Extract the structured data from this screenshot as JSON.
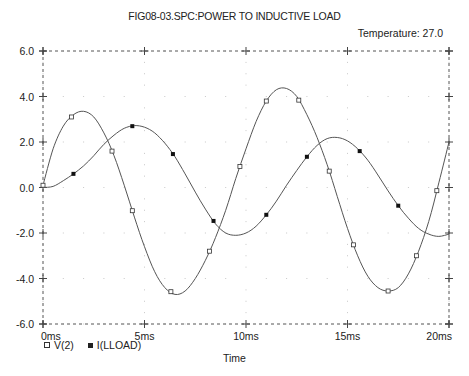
{
  "header": {
    "title": "FIG08-03.SPC:POWER TO INDUCTIVE LOAD",
    "temperature": "Temperature:  27.0"
  },
  "axes": {
    "xlabel": "Time",
    "x_ticks": [
      "0ms",
      "5ms",
      "10ms",
      "15ms",
      "20ms"
    ],
    "y_ticks": [
      "6.0",
      "4.0",
      "2.0",
      "0.0",
      "-2.0",
      "-4.0",
      "-6.0"
    ]
  },
  "legend": [
    {
      "label": "V(2)",
      "marker": "open-square"
    },
    {
      "label": "I(LLOAD)",
      "marker": "filled-square"
    }
  ],
  "chart_data": {
    "type": "line",
    "title": "FIG08-03.SPC:POWER TO INDUCTIVE LOAD",
    "annotation": "Temperature: 27.0",
    "xlabel": "Time",
    "ylabel": "",
    "xlim": [
      0,
      20
    ],
    "ylim": [
      -6,
      6
    ],
    "x_unit": "ms",
    "grid": true,
    "legend_position": "bottom-left",
    "x": [
      0,
      0.5,
      1,
      1.5,
      2,
      2.5,
      3,
      3.5,
      4,
      4.5,
      5,
      5.5,
      6,
      6.5,
      7,
      7.5,
      8,
      8.5,
      9,
      9.5,
      10,
      10.5,
      11,
      11.5,
      12,
      12.5,
      13,
      13.5,
      14,
      14.5,
      15,
      15.5,
      16,
      16.5,
      17,
      17.5,
      18,
      18.5,
      19,
      19.5,
      20
    ],
    "series": [
      {
        "name": "V(2)",
        "marker": "open-square",
        "values": [
          0.1,
          1.7,
          2.7,
          3.2,
          3.35,
          3.1,
          2.4,
          1.4,
          0.1,
          -1.3,
          -2.6,
          -3.7,
          -4.4,
          -4.7,
          -4.55,
          -4.0,
          -3.2,
          -2.2,
          -1.0,
          0.4,
          1.7,
          2.9,
          3.8,
          4.3,
          4.35,
          4.0,
          3.2,
          2.2,
          1.0,
          -0.4,
          -1.8,
          -3.0,
          -3.9,
          -4.4,
          -4.55,
          -4.4,
          -3.8,
          -2.8,
          -1.5,
          0.2,
          2.0
        ],
        "marker_x": [
          0.0,
          1.4,
          3.4,
          4.4,
          6.3,
          8.2,
          9.7,
          11.0,
          12.6,
          14.1,
          15.3,
          17.0,
          18.4,
          19.4
        ]
      },
      {
        "name": "I(LLOAD)",
        "marker": "filled-square",
        "values": [
          0,
          0.05,
          0.3,
          0.6,
          0.95,
          1.4,
          1.9,
          2.3,
          2.6,
          2.72,
          2.65,
          2.4,
          1.95,
          1.35,
          0.6,
          -0.2,
          -0.95,
          -1.6,
          -2.0,
          -2.1,
          -2.0,
          -1.7,
          -1.2,
          -0.6,
          0.1,
          0.75,
          1.35,
          1.85,
          2.15,
          2.2,
          2.05,
          1.7,
          1.2,
          0.55,
          -0.15,
          -0.8,
          -1.35,
          -1.8,
          -2.05,
          -2.15,
          -2.05
        ],
        "marker_x": [
          1.5,
          4.4,
          6.4,
          8.4,
          11.0,
          13.0,
          15.6,
          17.5
        ]
      }
    ]
  }
}
